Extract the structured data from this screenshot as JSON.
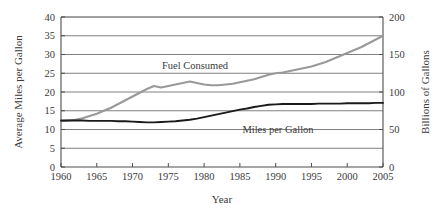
{
  "chart_data": {
    "type": "line",
    "title": "",
    "xlabel": "Year",
    "ylabel": "Average Miles per Gallon",
    "y2label": "Billions of Gallons",
    "xlim": [
      1960,
      2005
    ],
    "ylim": [
      0,
      40
    ],
    "y2lim": [
      0,
      200
    ],
    "grid": true,
    "legend_position": "inline-annotations",
    "xticks": [
      1960,
      1965,
      1970,
      1975,
      1980,
      1985,
      1990,
      1995,
      2000,
      2005
    ],
    "xtick_labels": [
      "1960",
      "1965",
      "1970",
      "1975",
      "1980",
      "1985",
      "1990",
      "1995",
      "2000",
      "2005"
    ],
    "yticks": [
      0,
      5,
      10,
      15,
      20,
      25,
      30,
      35,
      40
    ],
    "ytick_labels": [
      "0",
      "5",
      "10",
      "15",
      "20",
      "25",
      "30",
      "35",
      "40"
    ],
    "y2ticks": [
      0,
      50,
      100,
      150,
      200
    ],
    "y2tick_labels": [
      "0",
      "50",
      "100",
      "150",
      "200"
    ],
    "series": [
      {
        "name": "Miles per Gallon",
        "axis": "left",
        "color": "#1a1a1a",
        "units": "miles per gallon",
        "annotation": "Miles per Gallon",
        "x": [
          1960,
          1961,
          1962,
          1963,
          1964,
          1965,
          1966,
          1967,
          1968,
          1969,
          1970,
          1971,
          1972,
          1973,
          1974,
          1975,
          1976,
          1977,
          1978,
          1979,
          1980,
          1981,
          1982,
          1983,
          1984,
          1985,
          1986,
          1987,
          1988,
          1989,
          1990,
          1991,
          1992,
          1993,
          1994,
          1995,
          1996,
          1997,
          1998,
          1999,
          2000,
          2001,
          2002,
          2003,
          2004,
          2005
        ],
        "values": [
          12.4,
          12.4,
          12.4,
          12.4,
          12.3,
          12.3,
          12.3,
          12.3,
          12.2,
          12.2,
          12.1,
          12.0,
          11.9,
          11.9,
          12.0,
          12.1,
          12.2,
          12.4,
          12.6,
          12.9,
          13.3,
          13.7,
          14.1,
          14.5,
          14.9,
          15.3,
          15.6,
          16.0,
          16.3,
          16.6,
          16.7,
          16.8,
          16.8,
          16.8,
          16.8,
          16.8,
          16.9,
          16.9,
          16.9,
          16.9,
          17.0,
          17.0,
          17.0,
          17.0,
          17.1,
          17.1
        ]
      },
      {
        "name": "Fuel Consumed",
        "axis": "right",
        "color": "#999999",
        "units": "billions of gallons",
        "annotation": "Fuel Consumed",
        "x": [
          1960,
          1961,
          1962,
          1963,
          1964,
          1965,
          1966,
          1967,
          1968,
          1969,
          1970,
          1971,
          1972,
          1973,
          1974,
          1975,
          1976,
          1977,
          1978,
          1979,
          1980,
          1981,
          1982,
          1983,
          1984,
          1985,
          1986,
          1987,
          1988,
          1989,
          1990,
          1991,
          1992,
          1993,
          1994,
          1995,
          1996,
          1997,
          1998,
          1999,
          2000,
          2001,
          2002,
          2003,
          2004,
          2005
        ],
        "values": [
          61,
          62,
          63,
          65,
          68,
          71,
          75,
          79,
          84,
          89,
          94,
          99,
          104,
          108,
          106,
          108,
          110,
          112,
          114,
          112,
          110,
          109,
          109,
          110,
          111,
          113,
          115,
          117,
          120,
          123,
          125,
          126,
          128,
          130,
          132,
          134,
          137,
          140,
          144,
          148,
          152,
          156,
          160,
          165,
          170,
          175
        ]
      }
    ]
  },
  "colors": {
    "axis": "#4d4d4d",
    "grid": "#808080",
    "mpg_line": "#1a1a1a",
    "fuel_line": "#999999",
    "text": "#3a3a3a",
    "background": "#ffffff"
  }
}
